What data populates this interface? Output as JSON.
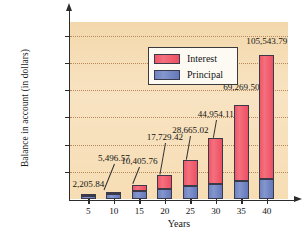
{
  "chart_data": {
    "type": "bar",
    "stacked": true,
    "title": "",
    "xlabel": "Years",
    "ylabel": "Balance in account (in dollars)",
    "categories": [
      "5",
      "10",
      "15",
      "20",
      "25",
      "30",
      "35",
      "40"
    ],
    "ylim": [
      0,
      130000
    ],
    "yticks": [
      20000,
      40000,
      60000,
      80000,
      100000,
      120000
    ],
    "ytick_labels": [
      "20,000",
      "40,000",
      "60,000",
      "80,000",
      "100,000",
      "120,000"
    ],
    "grid": true,
    "legend_position": "top-left",
    "series": [
      {
        "name": "Principal",
        "color": "#6d82c0",
        "values": [
          2000,
          3800,
          5600,
          7400,
          9200,
          11000,
          12900,
          14800
        ]
      },
      {
        "name": "Interest",
        "color": "#ef5768",
        "values": [
          205.84,
          1696.57,
          4805.76,
          10329.42,
          19465.02,
          33954.11,
          56369.5,
          90743.79
        ]
      }
    ],
    "totals": [
      2205.84,
      5496.57,
      10405.76,
      17729.42,
      28665.02,
      44954.11,
      69269.5,
      105543.79
    ],
    "total_labels": [
      "2,205.84",
      "5,496.57",
      "10,405.76",
      "17,729.42",
      "28,665.02",
      "44,954.11",
      "69,269.50",
      "105,543.79"
    ],
    "annotations": []
  },
  "legend": {
    "items": [
      {
        "label": "Interest",
        "color": "#ef5768"
      },
      {
        "label": "Principal",
        "color": "#6d82c0"
      }
    ]
  },
  "axes": {
    "y_title": "Balance in account (in dollars)",
    "x_title": "Years"
  },
  "colors": {
    "plot_background": "#f6dfbb",
    "interest": "#ef5768",
    "principal": "#6d82c0",
    "axis": "#2c2c2c",
    "gridline": "#b9895b",
    "text": "#141414"
  }
}
